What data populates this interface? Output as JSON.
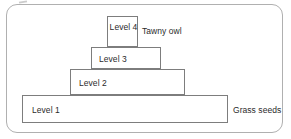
{
  "figure": {
    "type": "trophic-pyramid",
    "panel": {
      "border_color": "#b0b0b0",
      "background_color": "#ffffff"
    },
    "box_border_color": "#7d7d7d",
    "text_color": "#2b2b2b",
    "tiers": [
      {
        "id": "level-4",
        "label": "Level 4",
        "position": "top",
        "width_rank": 1
      },
      {
        "id": "level-3",
        "label": "Level 3",
        "position": "upper-middle",
        "width_rank": 2
      },
      {
        "id": "level-2",
        "label": "Level 2",
        "position": "lower-middle",
        "width_rank": 3
      },
      {
        "id": "level-1",
        "label": "Level 1",
        "position": "base",
        "width_rank": 4
      }
    ],
    "annotations": [
      {
        "id": "top-annotation",
        "text": "Tawny owl",
        "refers_to": "level-4"
      },
      {
        "id": "base-annotation",
        "text": "Grass seeds",
        "refers_to": "level-1"
      }
    ]
  }
}
